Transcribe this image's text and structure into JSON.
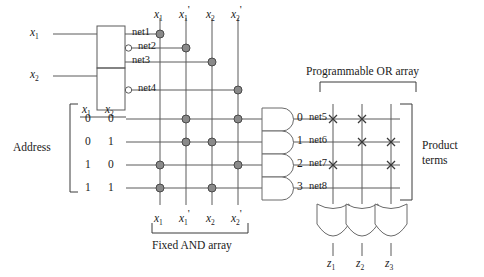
{
  "figure": {
    "type": "pla-pal-logic-diagram"
  },
  "colors": {
    "line": "#5a5a5a",
    "dot_fill": "#8a8a8a",
    "dot_stroke": "#4a4a4a",
    "text": "#1a1a1a",
    "gate_stroke": "#6a6a6a",
    "cross": "#3a3a3a"
  },
  "inputs": {
    "x1_label": "x",
    "x1_sub": "1",
    "x2_label": "x",
    "x2_sub": "2"
  },
  "buffer_nets": [
    {
      "name": "net1",
      "inverted": false
    },
    {
      "name": "net2",
      "inverted": true
    },
    {
      "name": "net3",
      "inverted": false
    },
    {
      "name": "net4",
      "inverted": true
    }
  ],
  "column_labels_top": [
    {
      "base": "x",
      "sub": "1",
      "prime": ""
    },
    {
      "base": "x",
      "sub": "1",
      "prime": "'"
    },
    {
      "base": "x",
      "sub": "2",
      "prime": ""
    },
    {
      "base": "x",
      "sub": "2",
      "prime": "'"
    }
  ],
  "column_labels_bottom": [
    {
      "base": "x",
      "sub": "1",
      "prime": ""
    },
    {
      "base": "x",
      "sub": "1",
      "prime": "'"
    },
    {
      "base": "x",
      "sub": "2",
      "prime": ""
    },
    {
      "base": "x",
      "sub": "2",
      "prime": "'"
    }
  ],
  "address": {
    "label": "Address",
    "header": [
      {
        "base": "x",
        "sub": "1"
      },
      {
        "base": "x",
        "sub": "2"
      }
    ],
    "rows": [
      {
        "bits": [
          "0",
          "0"
        ]
      },
      {
        "bits": [
          "0",
          "1"
        ]
      },
      {
        "bits": [
          "1",
          "0"
        ]
      },
      {
        "bits": [
          "1",
          "1"
        ]
      }
    ]
  },
  "and_array": {
    "caption": "Fixed AND array",
    "columns": [
      "x1",
      "x1'",
      "x2",
      "x2'"
    ],
    "rows": [
      {
        "address": "0 0",
        "connections": [
          0,
          1,
          0,
          1
        ]
      },
      {
        "address": "0 1",
        "connections": [
          0,
          1,
          1,
          0
        ]
      },
      {
        "address": "1 0",
        "connections": [
          1,
          0,
          0,
          1
        ]
      },
      {
        "address": "1 1",
        "connections": [
          1,
          0,
          1,
          0
        ]
      }
    ]
  },
  "and_gates": [
    {
      "index": "0",
      "net": "net5"
    },
    {
      "index": "1",
      "net": "net6"
    },
    {
      "index": "2",
      "net": "net7"
    },
    {
      "index": "3",
      "net": "net8"
    }
  ],
  "or_array": {
    "caption": "Programmable OR array",
    "product_terms_label_line1": "Product",
    "product_terms_label_line2": "terms",
    "columns": [
      "z1",
      "z2",
      "z3"
    ],
    "rows": [
      {
        "net": "net5",
        "crosses": [
          1,
          1,
          0
        ]
      },
      {
        "net": "net6",
        "crosses": [
          0,
          1,
          1
        ]
      },
      {
        "net": "net7",
        "crosses": [
          1,
          0,
          1
        ]
      },
      {
        "net": "net8",
        "crosses": [
          0,
          0,
          0
        ]
      }
    ]
  },
  "outputs": [
    {
      "base": "z",
      "sub": "1"
    },
    {
      "base": "z",
      "sub": "2"
    },
    {
      "base": "z",
      "sub": "3"
    }
  ]
}
